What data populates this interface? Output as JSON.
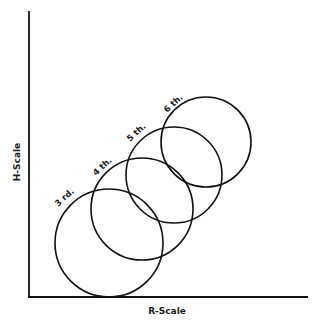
{
  "diagram": {
    "x_axis_label": "R-Scale",
    "y_axis_label": "H-Scale",
    "circles": [
      {
        "label": "3 rd.",
        "cx": 109,
        "cy": 243,
        "r": 54
      },
      {
        "label": "4 th.",
        "cx": 142,
        "cy": 209,
        "r": 51
      },
      {
        "label": "5 th.",
        "cx": 174,
        "cy": 175,
        "r": 48
      },
      {
        "label": "6 th.",
        "cx": 206,
        "cy": 142,
        "r": 45
      }
    ],
    "colors": {
      "line": "#111111",
      "background": "#ffffff"
    }
  }
}
